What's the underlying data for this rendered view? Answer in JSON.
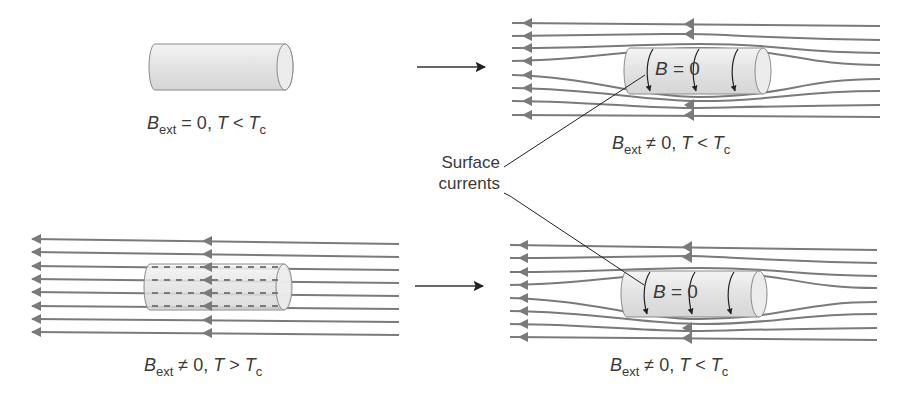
{
  "panels": {
    "top_left": {
      "caption": {
        "B": "B",
        "sub": "ext",
        "rel": " = 0, ",
        "T": "T",
        "op": " < ",
        "Tc": "T",
        "csub": "c"
      },
      "field_lines": 0,
      "state": "normal, no field"
    },
    "top_right": {
      "caption": {
        "B": "B",
        "sub": "ext",
        "rel": " ≠ 0, ",
        "T": "T",
        "op": " < ",
        "Tc": "T",
        "csub": "c"
      },
      "inner_label": {
        "B": "B",
        "rest": " = 0"
      },
      "field_lines": 8,
      "state": "superconducting, field expelled"
    },
    "bottom_left": {
      "caption": {
        "B": "B",
        "sub": "ext",
        "rel": " ≠ 0, ",
        "T": "T",
        "op": " > ",
        "Tc": "T",
        "csub": "c"
      },
      "field_lines": 8,
      "state": "normal, field penetrates"
    },
    "bottom_right": {
      "caption": {
        "B": "B",
        "sub": "ext",
        "rel": " ≠ 0, ",
        "T": "T",
        "op": " < ",
        "Tc": "T",
        "csub": "c"
      },
      "inner_label": {
        "B": "B",
        "rest": " = 0"
      },
      "field_lines": 8,
      "state": "superconducting, field expelled"
    }
  },
  "annotation": {
    "line1": "Surface",
    "line2": "currents"
  },
  "transitions": [
    {
      "from": "top_left",
      "to": "top_right",
      "icon": "right-arrow-icon"
    },
    {
      "from": "bottom_left",
      "to": "bottom_right",
      "icon": "right-arrow-icon"
    }
  ],
  "colors": {
    "field_line": "#7a7a7a",
    "cylinder_fill": "#e4e4e4",
    "text": "#3a3a3a",
    "arrow": "#222222"
  }
}
